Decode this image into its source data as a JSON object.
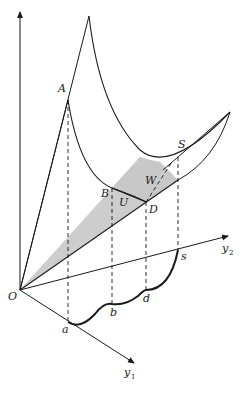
{
  "diagram": {
    "type": "3D utility surface with budget plane",
    "colors": {
      "line": "#1a1a1a",
      "shade": "#c8c8c8",
      "background": "#ffffff"
    },
    "labels": {
      "A": "A",
      "B": "B",
      "U": "U",
      "D": "D",
      "W": "W",
      "S": "S",
      "O": "O",
      "a": "a",
      "b": "b",
      "d": "d",
      "s": "s",
      "y1": "y",
      "y1_sub": "1",
      "y2": "y",
      "y2_sub": "2"
    }
  }
}
